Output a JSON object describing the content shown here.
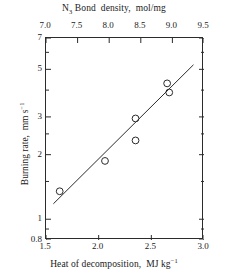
{
  "chart_data": {
    "type": "scatter",
    "title": "",
    "xlabel": "Heat of decomposition,  MJ kg⁻¹",
    "ylabel": "Burning rate,  mm s⁻¹",
    "x2label": "N₃ Bond density,  mol/mg",
    "xlim": [
      1.5,
      3.0
    ],
    "x2lim": [
      7.0,
      9.5
    ],
    "ylim": [
      0.8,
      7
    ],
    "yscale": "log",
    "xscale": "linear",
    "grid": false,
    "legend": false,
    "xticks": [
      "1.5",
      "2.0",
      "2.5",
      "3.0"
    ],
    "xtick_values": [
      1.5,
      2.0,
      2.5,
      3.0
    ],
    "x2ticks": [
      "7.0",
      "7.5",
      "8.0",
      "8.5",
      "9.0",
      "9.5"
    ],
    "x2tick_values": [
      7.0,
      7.5,
      8.0,
      8.5,
      9.0,
      9.5
    ],
    "yticks": [
      "7",
      "5",
      "3",
      "2",
      "1",
      "0.8"
    ],
    "ytick_values": [
      7,
      5,
      3,
      2,
      1,
      0.8
    ],
    "yminor_values": [
      6,
      4,
      2.5,
      1.5,
      0.9
    ],
    "marker": "open-circle",
    "points": [
      {
        "x": 1.63,
        "y": 1.35
      },
      {
        "x": 2.06,
        "y": 1.87
      },
      {
        "x": 2.35,
        "y": 2.95
      },
      {
        "x": 2.35,
        "y": 2.33
      },
      {
        "x": 2.65,
        "y": 4.3
      },
      {
        "x": 2.67,
        "y": 3.9
      }
    ],
    "fit_line": {
      "type": "linear-on-log-y",
      "x_start": 1.57,
      "y_start": 1.18,
      "x_end": 2.9,
      "y_end": 5.25
    }
  }
}
